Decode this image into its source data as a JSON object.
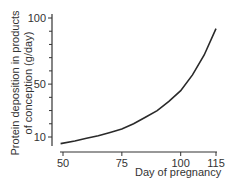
{
  "chart_data": {
    "type": "line",
    "title": "",
    "xlabel": "Day of pregnancy",
    "ylabel_line1": "Protein deposition in products",
    "ylabel_line2": "of conception (g/day)",
    "x_ticks": [
      50,
      75,
      100,
      115
    ],
    "y_ticks": [
      10,
      50,
      100
    ],
    "y_minor_step": 10,
    "xlim": [
      48,
      115
    ],
    "ylim": [
      4,
      100
    ],
    "grid": false,
    "legend": "none",
    "series": [
      {
        "name": "Protein deposition",
        "x": [
          49,
          55,
          60,
          65,
          70,
          75,
          80,
          85,
          90,
          95,
          100,
          105,
          110,
          115
        ],
        "y": [
          5,
          7,
          9,
          11,
          13.5,
          16,
          20,
          25,
          30,
          37,
          45,
          57,
          72,
          92
        ]
      }
    ]
  }
}
